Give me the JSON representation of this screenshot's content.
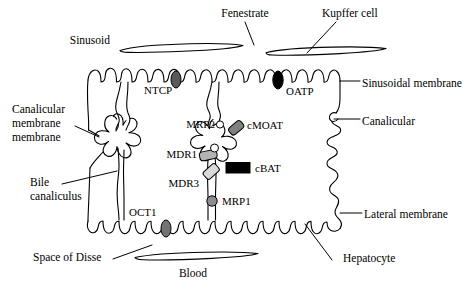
{
  "figure": {
    "type": "biological-schematic",
    "background_color": "#ffffff",
    "line_color": "#000000"
  },
  "anatomy_labels": {
    "sinusoid": "Sinusoid",
    "fenestrate": "Fenestrate",
    "kupffer_cell": "Kupffer cell",
    "sinusoidal_membrane": "Sinusoidal membrane",
    "canalicular": "Canalicular",
    "canalicular_membrane_line1": "Canalicular",
    "canalicular_membrane_line2": "membrane",
    "canalicular_membrane_line3": "membrane",
    "bile_line1": "Bile",
    "bile_line2": "canaliculus",
    "lateral_membrane": "Lateral membrane",
    "space_of_disse": "Space of Disse",
    "blood": "Blood",
    "hepatocyte": "Hepatocyte"
  },
  "transporters": [
    {
      "id": "ntcp",
      "label": "NTCP",
      "membrane": "sinusoidal",
      "marker": "oval",
      "color": "#595959"
    },
    {
      "id": "oatp",
      "label": "OATP",
      "membrane": "sinusoidal",
      "marker": "oval",
      "color": "#000000"
    },
    {
      "id": "mrp2",
      "label": "MRP2",
      "membrane": "canalicular",
      "marker": "circle-outline",
      "color": "#ffffff"
    },
    {
      "id": "cmoat",
      "label": "cMOAT",
      "membrane": "canalicular",
      "marker": "tilted-rect",
      "color": "#808080"
    },
    {
      "id": "mdr1",
      "label": "MDR1",
      "membrane": "canalicular",
      "marker": "rounded-rect",
      "color": "#b3b3b3"
    },
    {
      "id": "cbat",
      "label": "cBAT",
      "membrane": "canalicular",
      "marker": "rect",
      "color": "#000000"
    },
    {
      "id": "mdr3",
      "label": "MDR3",
      "membrane": "canalicular",
      "marker": "tilted-rect",
      "color": "#d9d9d9"
    },
    {
      "id": "mrp1",
      "label": "MRP1",
      "membrane": "lateral",
      "marker": "circle",
      "color": "#8c8c8c"
    },
    {
      "id": "oct1",
      "label": "OCT1",
      "membrane": "lateral",
      "marker": "oval",
      "color": "#737373"
    }
  ]
}
